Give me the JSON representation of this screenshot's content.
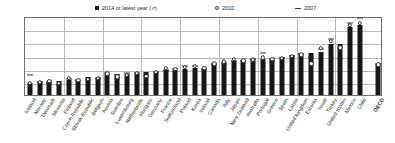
{
  "chart_data": {
    "type": "bar",
    "title": "",
    "xlabel": "",
    "ylabel": "",
    "ylim": [
      0.2,
      0.5
    ],
    "ytick_labels": [
      "0.50",
      "0.45",
      "0.40",
      "0.35",
      "0.30",
      "0.25",
      "0.20"
    ],
    "ytick_values": [
      0.5,
      0.45,
      0.4,
      0.35,
      0.3,
      0.25,
      0.2
    ],
    "grid": true,
    "legend_position": "top",
    "legend": [
      {
        "key": "bar2014",
        "label": "2014 or latest year (↗)",
        "marker": "square",
        "color": "#171717"
      },
      {
        "key": "dot2010",
        "label": "2010",
        "marker": "circle",
        "color": "#2b2b2b"
      },
      {
        "key": "dash2007",
        "label": "2007",
        "marker": "dash",
        "color": "#343434"
      }
    ],
    "categories": [
      "Iceland",
      "Norway",
      "Denmark",
      "Slovenia",
      "Finland",
      "Czech Republic",
      "Slovak Republic",
      "Belgium",
      "Austria",
      "Sweden",
      "Luxembourg",
      "Netherlands",
      "Hungary",
      "Germany",
      "France",
      "Switzerland",
      "Poland",
      "Korea",
      "Ireland",
      "Canada",
      "Italy",
      "Japan",
      "New Zealand",
      "Australia",
      "Portugal",
      "Greece",
      "Spain",
      "Latvia",
      "United Kingdom",
      "Estonia",
      "Israel",
      "Turkey",
      "United States",
      "Mexico",
      "Chile",
      "OECD"
    ],
    "series": [
      {
        "name": "2014 or latest year (↗)",
        "values": [
          0.244,
          0.252,
          0.254,
          0.255,
          0.257,
          0.258,
          0.269,
          0.268,
          0.28,
          0.281,
          0.281,
          0.283,
          0.288,
          0.289,
          0.294,
          0.295,
          0.3,
          0.302,
          0.298,
          0.322,
          0.325,
          0.33,
          0.333,
          0.337,
          0.338,
          0.34,
          0.346,
          0.352,
          0.358,
          0.361,
          0.365,
          0.393,
          0.394,
          0.459,
          0.465,
          0.318
        ]
      },
      {
        "name": "2010",
        "values": [
          0.246,
          0.249,
          0.252,
          0.246,
          0.264,
          0.257,
          0.261,
          0.264,
          0.281,
          0.269,
          0.276,
          0.282,
          0.272,
          0.286,
          0.303,
          0.298,
          0.305,
          0.31,
          0.302,
          0.319,
          0.327,
          0.336,
          0.33,
          0.334,
          0.342,
          0.337,
          0.34,
          0.348,
          0.353,
          0.319,
          0.377,
          0.404,
          0.38,
          0.466,
          0.473,
          0.315
        ]
      },
      {
        "name": "2007",
        "values": [
          0.276,
          0.248,
          0.247,
          0.238,
          0.262,
          0.256,
          0.258,
          0.262,
          0.284,
          0.259,
          0.282,
          0.284,
          0.271,
          0.289,
          0.295,
          0.299,
          0.311,
          0.312,
          0.3,
          0.318,
          0.318,
          0.329,
          0.33,
          0.336,
          0.36,
          0.328,
          0.339,
          0.348,
          0.356,
          0.346,
          0.373,
          0.411,
          0.377,
          0.474,
          0.494,
          0.316
        ]
      }
    ]
  }
}
